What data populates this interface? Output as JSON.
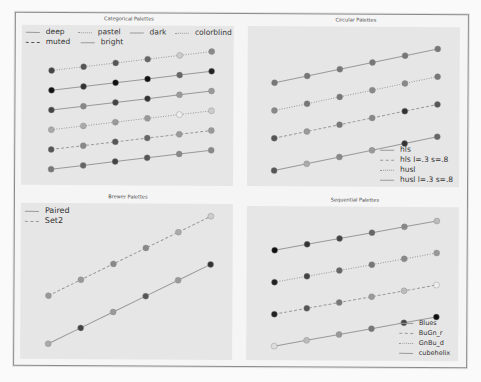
{
  "chart_data": [
    {
      "type": "line",
      "title": "Categorical Palettes",
      "x": [
        0,
        1,
        2,
        3,
        4,
        5
      ],
      "legend_position": "top",
      "series": [
        {
          "name": "deep",
          "style": "solid",
          "values": [
            1,
            1.2,
            1.4,
            1.6,
            1.8,
            2.0
          ],
          "point_gray": [
            "#777",
            "#666",
            "#444",
            "#555",
            "#888",
            "#888"
          ]
        },
        {
          "name": "muted",
          "style": "dashed",
          "values": [
            2,
            2.2,
            2.4,
            2.6,
            2.8,
            3.0
          ],
          "point_gray": [
            "#555",
            "#888",
            "#555",
            "#666",
            "#999",
            "#999"
          ]
        },
        {
          "name": "pastel",
          "style": "dotted",
          "values": [
            3,
            3.2,
            3.4,
            3.6,
            3.8,
            4.0
          ],
          "point_gray": [
            "#aaa",
            "#aaa",
            "#999",
            "#999",
            "#eee",
            "#ccc"
          ]
        },
        {
          "name": "bright",
          "style": "solid",
          "values": [
            4,
            4.2,
            4.4,
            4.6,
            4.8,
            5.0
          ],
          "point_gray": [
            "#444",
            "#888",
            "#444",
            "#333",
            "#999",
            "#999"
          ]
        },
        {
          "name": "dark",
          "style": "solid",
          "values": [
            5,
            5.2,
            5.4,
            5.6,
            5.8,
            6.0
          ],
          "point_gray": [
            "#111",
            "#333",
            "#111",
            "#111",
            "#666",
            "#222"
          ]
        },
        {
          "name": "colorblind",
          "style": "dotted",
          "values": [
            6,
            6.2,
            6.4,
            6.6,
            6.8,
            7.0
          ],
          "point_gray": [
            "#444",
            "#555",
            "#555",
            "#666",
            "#ccc",
            "#888"
          ]
        }
      ]
    },
    {
      "type": "line",
      "title": "Circular Palettes",
      "x": [
        0,
        1,
        2,
        3,
        4,
        5
      ],
      "legend_position": "lower right",
      "series": [
        {
          "name": "hls",
          "style": "solid",
          "values": [
            1,
            1.3,
            1.6,
            1.9,
            2.2,
            2.5
          ],
          "point_gray": [
            "#555",
            "#aaa",
            "#888",
            "#999",
            "#333",
            "#666"
          ]
        },
        {
          "name": "hls l=.3 s=.8",
          "style": "dashed",
          "values": [
            2.4,
            2.7,
            3.0,
            3.3,
            3.6,
            3.9
          ],
          "point_gray": [
            "#555",
            "#999",
            "#777",
            "#888",
            "#333",
            "#555"
          ]
        },
        {
          "name": "husl",
          "style": "dotted",
          "values": [
            3.6,
            3.9,
            4.2,
            4.5,
            4.8,
            5.1
          ],
          "point_gray": [
            "#888",
            "#777",
            "#777",
            "#888",
            "#888",
            "#777"
          ]
        },
        {
          "name": "husl l=.3 s=.8",
          "style": "solid",
          "values": [
            4.8,
            5.1,
            5.4,
            5.7,
            6.0,
            6.3
          ],
          "point_gray": [
            "#777",
            "#777",
            "#777",
            "#777",
            "#777",
            "#777"
          ]
        }
      ]
    },
    {
      "type": "line",
      "title": "Brewer Palettes",
      "x": [
        0,
        1,
        2,
        3,
        4,
        5
      ],
      "legend_position": "upper left",
      "series": [
        {
          "name": "Paired",
          "style": "solid",
          "values": [
            1,
            2,
            3,
            4,
            5,
            6
          ],
          "point_gray": [
            "#aaa",
            "#444",
            "#999",
            "#555",
            "#999",
            "#333"
          ]
        },
        {
          "name": "Set2",
          "style": "dashed",
          "values": [
            4,
            5,
            6,
            7,
            8,
            9
          ],
          "point_gray": [
            "#999",
            "#999",
            "#888",
            "#888",
            "#aaa",
            "#ccc"
          ]
        }
      ]
    },
    {
      "type": "line",
      "title": "Sequential Palettes",
      "x": [
        0,
        1,
        2,
        3,
        4,
        5
      ],
      "legend_position": "lower right",
      "series": [
        {
          "name": "Blues",
          "style": "solid",
          "values": [
            1,
            1.3,
            1.6,
            1.9,
            2.2,
            2.5
          ],
          "point_gray": [
            "#ddd",
            "#bbb",
            "#999",
            "#777",
            "#444",
            "#111"
          ]
        },
        {
          "name": "BuGn_r",
          "style": "dashed",
          "values": [
            2.6,
            2.9,
            3.2,
            3.5,
            3.8,
            4.1
          ],
          "point_gray": [
            "#222",
            "#555",
            "#777",
            "#999",
            "#bbb",
            "#eee"
          ]
        },
        {
          "name": "GnBu_d",
          "style": "dotted",
          "values": [
            4.2,
            4.5,
            4.8,
            5.1,
            5.4,
            5.7
          ],
          "point_gray": [
            "#222",
            "#444",
            "#666",
            "#777",
            "#888",
            "#999"
          ]
        },
        {
          "name": "cubehelix",
          "style": "solid",
          "values": [
            5.8,
            6.1,
            6.4,
            6.7,
            7.0,
            7.3
          ],
          "point_gray": [
            "#111",
            "#333",
            "#444",
            "#666",
            "#888",
            "#bbb"
          ]
        }
      ]
    }
  ],
  "panels": {
    "categorical": {
      "title": "Categorical Palettes",
      "legend": [
        "deep",
        "pastel",
        "dark",
        "colorblind",
        "muted",
        "bright"
      ]
    },
    "circular": {
      "title": "Circular Palettes",
      "legend": [
        "hls",
        "hls l=.3 s=.8",
        "husl",
        "husl l=.3 s=.8"
      ]
    },
    "brewer": {
      "title": "Brewer Palettes",
      "legend": [
        "Paired",
        "Set2"
      ]
    },
    "sequential": {
      "title": "Sequential Palettes",
      "legend": [
        "Blues",
        "BuGn_r",
        "GnBu_d",
        "cubehelix"
      ]
    }
  }
}
